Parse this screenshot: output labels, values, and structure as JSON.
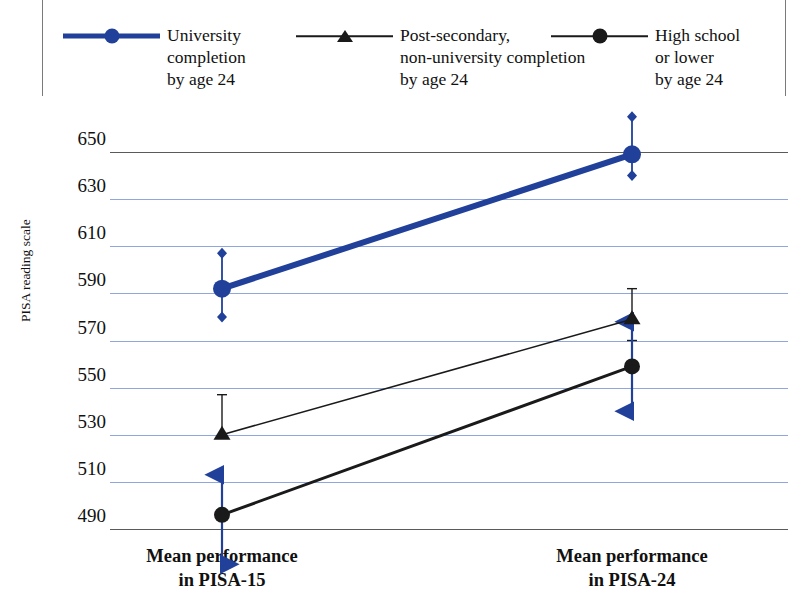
{
  "legend": {
    "items": [
      {
        "label": "University\ncompletion\nby age 24",
        "marker": "circle-icon",
        "color": "#20409a",
        "style": "thick-blue-line"
      },
      {
        "label": "Post-secondary,\nnon-university completion\nby age 24",
        "marker": "triangle-icon",
        "color": "#1a1a1a",
        "style": "thin-black-line"
      },
      {
        "label": "High school\nor lower\nby age 24",
        "marker": "circle-icon",
        "color": "#1a1a1a",
        "style": "thick-black-line"
      }
    ]
  },
  "axes": {
    "y_title": "PISA reading scale",
    "y_ticks": [
      "650",
      "630",
      "610",
      "590",
      "570",
      "550",
      "530",
      "510",
      "490"
    ],
    "x_ticks": [
      "Mean performance\nin PISA-15",
      "Mean performance\nin PISA-24"
    ]
  },
  "chart_data": {
    "type": "line",
    "title": "",
    "xlabel": "",
    "ylabel": "PISA reading scale",
    "categories": [
      "Mean performance in PISA-15",
      "Mean performance in PISA-24"
    ],
    "ylim": [
      490,
      650
    ],
    "ytick_step": 20,
    "grid": "horizontal",
    "legend_position": "top",
    "series": [
      {
        "name": "University completion by age 24",
        "color": "#20409a",
        "marker": "circle",
        "linewidth": "thick",
        "values": [
          592,
          649
        ],
        "error_low": [
          580,
          640
        ],
        "error_high": [
          607,
          665
        ]
      },
      {
        "name": "Post-secondary, non-university completion by age 24",
        "color": "#1a1a1a",
        "marker": "triangle",
        "linewidth": "thin",
        "values": [
          530,
          579
        ],
        "error_low": [
          530,
          570
        ],
        "error_high": [
          547,
          592
        ]
      },
      {
        "name": "High school or lower by age 24",
        "color": "#1a1a1a",
        "marker": "circle",
        "linewidth": "thick",
        "values": [
          496,
          559
        ],
        "error_low": [
          496,
          559
        ],
        "error_high": [
          496,
          559
        ]
      }
    ],
    "annotations": [
      {
        "type": "arrow",
        "at": "Mean performance in PISA-15",
        "direction": "up",
        "from": 496,
        "to": 513,
        "color": "#20409a"
      },
      {
        "type": "arrow",
        "at": "Mean performance in PISA-15",
        "direction": "down",
        "from": 496,
        "to": 475,
        "color": "#20409a"
      },
      {
        "type": "arrow",
        "at": "Mean performance in PISA-24",
        "direction": "both",
        "from": 540,
        "to": 578,
        "color": "#20409a"
      }
    ]
  }
}
